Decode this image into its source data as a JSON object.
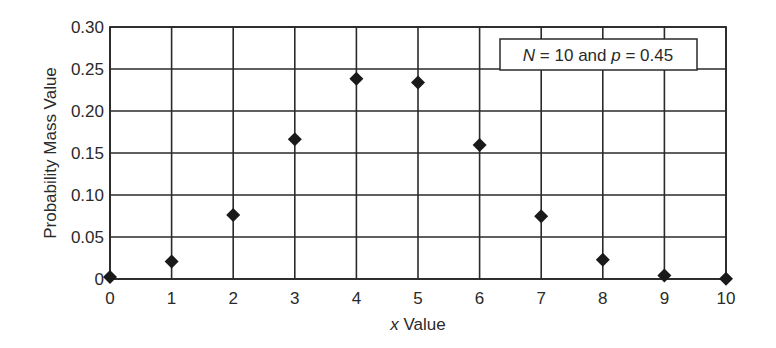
{
  "chart_data": {
    "type": "scatter",
    "title": "",
    "xlabel_italic": "x",
    "xlabel_rest": " Value",
    "xlabel": "x Value",
    "ylabel": "Probability Mass Value",
    "x": [
      0,
      1,
      2,
      3,
      4,
      5,
      6,
      7,
      8,
      9,
      10
    ],
    "values": [
      0.0025,
      0.0207,
      0.0763,
      0.1665,
      0.2384,
      0.234,
      0.1596,
      0.0746,
      0.0229,
      0.0042,
      0.0003
    ],
    "series": [
      {
        "name": "Binomial PMF (N = 10, p = 0.45)",
        "marker": "diamond",
        "color": "#1a1a1a",
        "x": [
          0,
          1,
          2,
          3,
          4,
          5,
          6,
          7,
          8,
          9,
          10
        ],
        "values": [
          0.0025,
          0.0207,
          0.0763,
          0.1665,
          0.2384,
          0.234,
          0.1596,
          0.0746,
          0.0229,
          0.0042,
          0.0003
        ]
      }
    ],
    "xlim": [
      0,
      10
    ],
    "ylim": [
      0,
      0.3
    ],
    "xticks": [
      "0",
      "1",
      "2",
      "3",
      "4",
      "5",
      "6",
      "7",
      "8",
      "9",
      "10"
    ],
    "yticks": [
      "0",
      "0.05",
      "0.10",
      "0.15",
      "0.20",
      "0.25",
      "0.30"
    ],
    "ytick_values": [
      0,
      0.05,
      0.1,
      0.15,
      0.2,
      0.25,
      0.3
    ],
    "grid": true,
    "legend": {
      "position": "top-right",
      "parts": [
        {
          "text": "N",
          "italic": true
        },
        {
          "text": " = 10 and ",
          "italic": false
        },
        {
          "text": "p",
          "italic": true
        },
        {
          "text": " = 0.45",
          "italic": false
        }
      ],
      "text": "N = 10 and p = 0.45"
    }
  }
}
